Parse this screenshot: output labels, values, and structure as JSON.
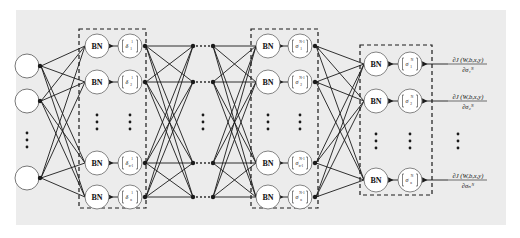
{
  "diagram": {
    "title": "",
    "background_color": "#ececec",
    "line_color": "#1a1a1a",
    "node_fill": "#ffffff",
    "input_layer": {
      "label": "input nodes",
      "nodes": [
        {
          "y": 66
        },
        {
          "y": 101
        },
        {
          "y": 178
        }
      ],
      "ellipsis": "⋮"
    },
    "layer_1": {
      "label": "layer 1",
      "rows": [
        {
          "bn": "BN",
          "sym": "δ",
          "sub": "1",
          "sup": "1",
          "y": 46
        },
        {
          "bn": "BN",
          "sym": "δ",
          "sub": "2",
          "sup": "1",
          "y": 82
        },
        {
          "bn": "BN",
          "sym": "δ",
          "sub": "n-1",
          "sup": "1",
          "y": 163
        },
        {
          "bn": "BN",
          "sym": "δ",
          "sub": "n",
          "sup": "1",
          "y": 197
        }
      ],
      "ellipsis": "⋮"
    },
    "hidden_gap": {
      "ellipsis_h": "· · ·",
      "ellipsis_v": "⋮"
    },
    "layer_n_minus_1": {
      "label": "layer N-1",
      "rows": [
        {
          "bn": "BN",
          "sym": "σ",
          "sub": "1",
          "sup": "N-1",
          "y": 46
        },
        {
          "bn": "BN",
          "sym": "σ",
          "sub": "2",
          "sup": "N-1",
          "y": 82
        },
        {
          "bn": "BN",
          "sym": "σ",
          "sub": "n-1",
          "sup": "N-1",
          "y": 163
        },
        {
          "bn": "BN",
          "sym": "σ",
          "sub": "n",
          "sup": "N-1",
          "y": 197
        }
      ],
      "ellipsis": "⋮"
    },
    "layer_n": {
      "label": "layer N",
      "rows": [
        {
          "bn": "BN",
          "sym": "σ",
          "sub": "1",
          "sup": "N",
          "y": 64
        },
        {
          "bn": "BN",
          "sym": "σ",
          "sub": "2",
          "sup": "N",
          "y": 101
        },
        {
          "bn": "BN",
          "sym": "σ",
          "sub": "n",
          "sup": "N",
          "y": 180
        }
      ],
      "ellipsis": "⋮"
    },
    "outputs": [
      {
        "numerator": "∂J (W,b,x,y)",
        "denominator": "∂σ₁ᴺ",
        "y": 64
      },
      {
        "numerator": "∂J (W,b,x,y)",
        "denominator": "∂σ₂ᴺ",
        "y": 101
      },
      {
        "numerator": "∂J (W,b,x,y)",
        "denominator": "∂σₙᴺ",
        "y": 180
      }
    ],
    "outputs_ellipsis": "⋮"
  }
}
